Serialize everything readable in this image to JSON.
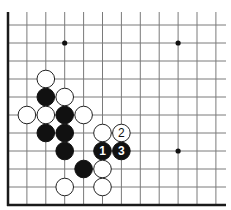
{
  "diagram": {
    "type": "go-board-corner",
    "grid": {
      "origin_x": 8,
      "origin_y": 25,
      "spacing_x": 18.9,
      "spacing_y": 18,
      "columns": 12,
      "rows": 11,
      "top_extend_y": 12,
      "right_extend_x": 226,
      "borders": [
        "left",
        "bottom"
      ]
    },
    "colors": {
      "black": "#111111",
      "white": "#ffffff",
      "line": "#7a7a7a",
      "border": "#1a1a1a"
    },
    "hoshi": [
      {
        "col": 3,
        "row": 1
      },
      {
        "col": 9,
        "row": 1
      },
      {
        "col": 9,
        "row": 7
      }
    ],
    "stones": [
      {
        "color": "white",
        "col": 2,
        "row": 3,
        "label": ""
      },
      {
        "color": "black",
        "col": 2,
        "row": 4,
        "label": ""
      },
      {
        "color": "white",
        "col": 3,
        "row": 4,
        "label": ""
      },
      {
        "color": "white",
        "col": 1,
        "row": 5,
        "label": ""
      },
      {
        "color": "white",
        "col": 2,
        "row": 5,
        "label": ""
      },
      {
        "color": "black",
        "col": 3,
        "row": 5,
        "label": ""
      },
      {
        "color": "white",
        "col": 4,
        "row": 5,
        "label": ""
      },
      {
        "color": "black",
        "col": 2,
        "row": 6,
        "label": ""
      },
      {
        "color": "black",
        "col": 3,
        "row": 6,
        "label": ""
      },
      {
        "color": "white",
        "col": 5,
        "row": 6,
        "label": ""
      },
      {
        "color": "white",
        "col": 6,
        "row": 6,
        "label": "2"
      },
      {
        "color": "black",
        "col": 3,
        "row": 7,
        "label": ""
      },
      {
        "color": "black",
        "col": 5,
        "row": 7,
        "label": "1"
      },
      {
        "color": "black",
        "col": 6,
        "row": 7,
        "label": "3"
      },
      {
        "color": "black",
        "col": 4,
        "row": 8,
        "label": ""
      },
      {
        "color": "white",
        "col": 5,
        "row": 8,
        "label": ""
      },
      {
        "color": "white",
        "col": 3,
        "row": 9,
        "label": ""
      },
      {
        "color": "white",
        "col": 5,
        "row": 9,
        "label": ""
      }
    ],
    "move_labels": [
      "1",
      "2",
      "3"
    ]
  }
}
